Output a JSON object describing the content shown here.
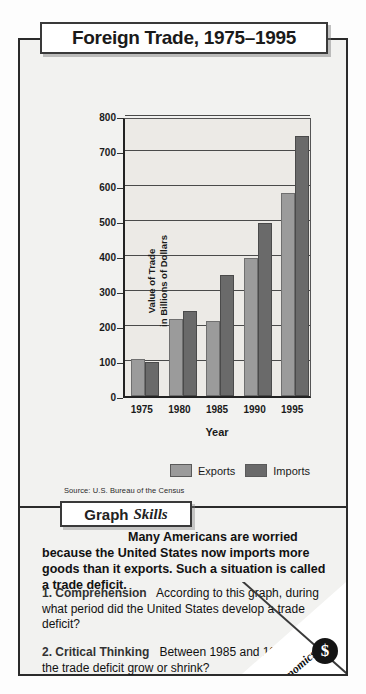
{
  "title": "Foreign Trade, 1975–1995",
  "chart_data": {
    "type": "bar",
    "title": "Foreign Trade, 1975–1995",
    "xlabel": "Year",
    "ylabel": "Value of Trade in Billions of Dollars",
    "ylabel_line1": "Value of Trade",
    "ylabel_line2": "in Billions of Dollars",
    "categories": [
      "1975",
      "1980",
      "1985",
      "1990",
      "1995"
    ],
    "series": [
      {
        "name": "Exports",
        "color": "#9b9b9b",
        "values": [
          107,
          220,
          213,
          393,
          580
        ]
      },
      {
        "name": "Imports",
        "color": "#6a6a6a",
        "values": [
          98,
          243,
          345,
          495,
          743
        ]
      }
    ],
    "ylim": [
      0,
      800
    ],
    "yticks": [
      "800",
      "700",
      "600",
      "500",
      "400",
      "300",
      "200",
      "100",
      "0"
    ],
    "ytick_values": [
      800,
      700,
      600,
      500,
      400,
      300,
      200,
      100,
      0
    ],
    "grid": true,
    "legend_position": "bottom"
  },
  "source": "Source:  U.S. Bureau of the Census",
  "skills": {
    "word1": "Graph",
    "word2": "Skills"
  },
  "intro": "Many Americans are worried because the United States now imports more goods than it exports. Such a situation is called a trade deficit.",
  "questions": [
    {
      "number": "1.",
      "category": "Comprehension",
      "text": "According to this graph, during what period did the United States develop a trade deficit?"
    },
    {
      "number": "2.",
      "category": "Critical Thinking",
      "text": "Between 1985 and 1990, did the trade deficit grow or shrink?"
    }
  ],
  "corner_badge": {
    "label": "Economics",
    "icon": "$"
  },
  "colors": {
    "exports": "#9b9b9b",
    "imports": "#6a6a6a",
    "frame": "#2b2b2b",
    "panel_bg": "#f2f2f0",
    "plot_bg": "#eceae6"
  }
}
